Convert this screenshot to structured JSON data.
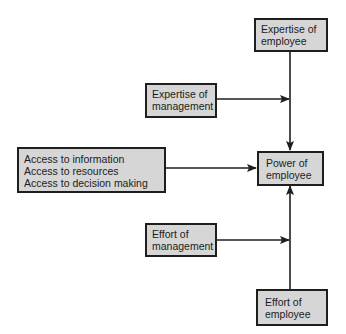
{
  "diagram": {
    "nodes": [
      {
        "id": "expertise_employee",
        "lines": [
          "Expertise of",
          "employee"
        ]
      },
      {
        "id": "expertise_management",
        "lines": [
          "Expertise of",
          "management"
        ]
      },
      {
        "id": "access",
        "lines": [
          "Access to information",
          "Access to resources",
          "Access to decision making"
        ]
      },
      {
        "id": "power",
        "lines": [
          "Power of",
          "employee"
        ]
      },
      {
        "id": "effort_management",
        "lines": [
          "Effort of",
          "management"
        ]
      },
      {
        "id": "effort_employee",
        "lines": [
          "Effort of",
          "employee"
        ]
      }
    ],
    "edges": [
      {
        "from": "expertise_employee",
        "to": "power"
      },
      {
        "from": "expertise_management",
        "to": "power",
        "joins": "vertical line from expertise_employee"
      },
      {
        "from": "access",
        "to": "power"
      },
      {
        "from": "effort_management",
        "to": "power",
        "joins": "vertical line from effort_employee"
      },
      {
        "from": "effort_employee",
        "to": "power"
      }
    ],
    "colors": {
      "box_fill": "#d6d6d6",
      "stroke": "#1e1e1e",
      "background": "#ffffff"
    }
  }
}
